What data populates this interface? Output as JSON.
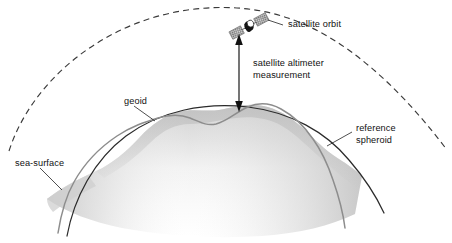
{
  "figure": {
    "background_color": "#ffffff"
  },
  "labels": {
    "satellite_orbit": "satellite orbit",
    "altimeter_line1": "satellite altimeter",
    "altimeter_line2": "measurement",
    "geoid": "geoid",
    "reference_spheroid_line1": "reference",
    "reference_spheroid_line2": "spheroid",
    "sea_surface": "sea-surface"
  },
  "colors": {
    "orbit_dash": "#3a3a3a",
    "spheroid_curve": "#2b2b2b",
    "geoid_curve": "#8a8a8a",
    "sea_surface_fill": "#d8d8d8",
    "sea_surface_fill_light": "#fbfbfb",
    "arrow": "#111111",
    "text": "#111111",
    "satellite_body": "#1a1a1a",
    "satellite_panel": "#9a9a9a"
  },
  "elements": {
    "orbit": {
      "name": "satellite orbit",
      "style": "dashed arc",
      "dash_pattern": "6 4"
    },
    "reference_spheroid": {
      "name": "reference spheroid",
      "style": "solid smooth arc"
    },
    "geoid": {
      "name": "geoid",
      "style": "solid undulating curve"
    },
    "sea_surface": {
      "name": "sea-surface",
      "style": "grey shaded surface"
    },
    "altimeter_measurement": {
      "name": "satellite altimeter measurement",
      "style": "double-headed vertical arrow"
    },
    "satellite": {
      "name": "satellite",
      "parts": [
        "body",
        "solar panel left",
        "solar panel right"
      ]
    }
  }
}
